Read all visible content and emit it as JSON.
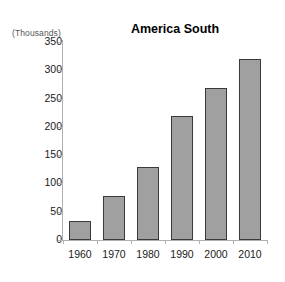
{
  "chart_data": {
    "type": "bar",
    "title": "America South",
    "unit_label": "(Thousands)",
    "xlabel": "",
    "ylabel": "",
    "categories": [
      "1960",
      "1970",
      "1980",
      "1990",
      "2000",
      "2010"
    ],
    "values": [
      33,
      78,
      129,
      220,
      268,
      320
    ],
    "ylim": [
      0,
      350
    ],
    "ytick_step": 50,
    "ytick_labels": [
      "0",
      "50",
      "100",
      "150",
      "200",
      "250",
      "300",
      "350"
    ],
    "grid": false,
    "legend": null,
    "series": [
      {
        "name": "America South",
        "values": [
          33,
          78,
          129,
          220,
          268,
          320
        ]
      }
    ],
    "colors": {
      "bar_fill": "#a0a0a0",
      "bar_border": "#3a3a3a",
      "axis": "#b0b0b0",
      "text": "#1a1a1a",
      "unit_text": "#555555",
      "background": "#ffffff"
    }
  }
}
